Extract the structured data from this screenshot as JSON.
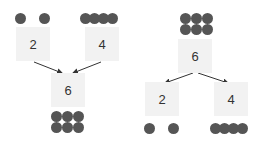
{
  "diagrams": [
    {
      "name": "combine",
      "inputs": [
        {
          "label": "2",
          "dots": 2
        },
        {
          "label": "4",
          "dots": 4
        }
      ],
      "output": {
        "label": "6",
        "dots": 6
      }
    },
    {
      "name": "split",
      "input": {
        "label": "6",
        "dots": 6
      },
      "outputs": [
        {
          "label": "2",
          "dots": 2
        },
        {
          "label": "4",
          "dots": 4
        }
      ]
    }
  ],
  "colors": {
    "box": "#f2f2f2",
    "dot": "#555555",
    "arrow": "#333333"
  }
}
